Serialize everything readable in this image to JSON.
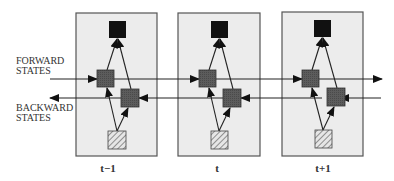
{
  "diagram": {
    "labels": {
      "forward_line1": "FORWARD",
      "forward_line2": "STATES",
      "backward_line1": "BACKWARD",
      "backward_line2": "STATES"
    },
    "timesteps": [
      {
        "label": "t−1"
      },
      {
        "label": "t"
      },
      {
        "label": "t+1"
      }
    ],
    "nodes": {
      "output": "black square",
      "forward_state": "dark gray square",
      "backward_state": "dark gray square",
      "input": "hatched square"
    },
    "colors": {
      "box_fill": "#ececec",
      "box_stroke": "#555555",
      "output_fill": "#111111",
      "state_fill": "#5a5a5a",
      "input_fill": "#d8d8d8",
      "line": "#222222"
    }
  }
}
